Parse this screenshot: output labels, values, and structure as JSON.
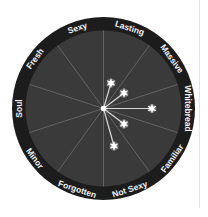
{
  "diagram": {
    "type": "radial-star-map",
    "center": [
      103.5,
      108.5
    ],
    "outer_radius": 91.5,
    "inner_radius": 78,
    "colors": {
      "ring": "#1c1c1c",
      "face": "#3a3a3a",
      "spokes": "#6e6e6e",
      "label": "#f2f2f2",
      "star": "#ffffff",
      "ray": "#d8d8d8"
    },
    "spoke_angles_deg": [
      0,
      36,
      72,
      108,
      144
    ],
    "labels": [
      {
        "text": "Lasting",
        "angle": 18
      },
      {
        "text": "Massive",
        "angle": 54
      },
      {
        "text": "Whitebread",
        "angle": 90
      },
      {
        "text": "Familiar",
        "angle": 126
      },
      {
        "text": "Not Sexy",
        "angle": 162
      },
      {
        "text": "Forgotten",
        "angle": 198
      },
      {
        "text": "Minor",
        "angle": 234
      },
      {
        "text": "Soul",
        "angle": 270
      },
      {
        "text": "Fresh",
        "angle": 306
      },
      {
        "text": "Sexy",
        "angle": 342
      }
    ],
    "stars": [
      {
        "dx": 7.5,
        "dy": -25.5
      },
      {
        "dx": 20.5,
        "dy": -15.5
      },
      {
        "dx": 48.5,
        "dy": 0
      },
      {
        "dx": 20.5,
        "dy": 15.5
      },
      {
        "dx": 10.5,
        "dy": 37.5
      }
    ]
  }
}
